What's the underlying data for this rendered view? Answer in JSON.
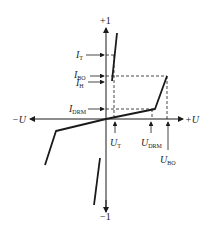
{
  "diagram": {
    "type": "thyristor/DIAC volt-ampere characteristic",
    "axes": {
      "y_positive_label": "+1",
      "y_negative_label": "−1",
      "x_positive_label": "+U",
      "x_negative_label": "−U"
    },
    "current_markers": [
      {
        "main": "I",
        "sub": "T"
      },
      {
        "main": "I",
        "sub": "BO"
      },
      {
        "main": "I",
        "sub": "H"
      },
      {
        "main": "I",
        "sub": "DRM"
      }
    ],
    "voltage_markers": [
      {
        "main": "U",
        "sub": "T"
      },
      {
        "main": "U",
        "sub": "DRM"
      },
      {
        "main": "U",
        "sub": "BO"
      }
    ],
    "colors": {
      "line": "#1a1a1a",
      "background": "#ffffff"
    }
  }
}
